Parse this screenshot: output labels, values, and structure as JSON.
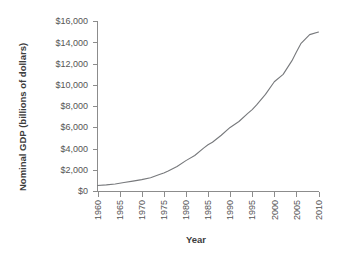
{
  "chart_data": {
    "type": "line",
    "title": "",
    "xlabel": "Year",
    "ylabel": "Nominal GDP (billions of dollars)",
    "x": [
      1960,
      1965,
      1970,
      1975,
      1980,
      1985,
      1990,
      1995,
      2000,
      2005,
      2010
    ],
    "values": [
      520,
      740,
      1070,
      1690,
      2860,
      4350,
      5980,
      7660,
      10280,
      13090,
      14960
    ],
    "xlim": [
      1960,
      2010
    ],
    "ylim": [
      0,
      16000
    ],
    "xticks": [
      1960,
      1965,
      1970,
      1975,
      1980,
      1985,
      1990,
      1995,
      2000,
      2005,
      2010
    ],
    "xtick_labels": [
      "1960",
      "1965",
      "1970",
      "1975",
      "1980",
      "1985",
      "1990",
      "1995",
      "2000",
      "2005",
      "2010"
    ],
    "yticks": [
      0,
      2000,
      4000,
      6000,
      8000,
      10000,
      12000,
      14000,
      16000
    ],
    "ytick_labels": [
      "$0",
      "$2,000",
      "$4,000",
      "$6,000",
      "$8,000",
      "$10,000",
      "$12,000",
      "$14,000",
      "$16,000"
    ],
    "grid": false,
    "legend": false,
    "series": [
      {
        "name": "Nominal GDP",
        "color": "#77797c",
        "values": [
          520,
          740,
          1070,
          1690,
          2860,
          4350,
          5980,
          7660,
          10280,
          13090,
          14960
        ]
      }
    ],
    "dense_points": {
      "x": [
        1960,
        1962,
        1964,
        1966,
        1968,
        1970,
        1972,
        1974,
        1975,
        1976,
        1978,
        1980,
        1982,
        1984,
        1985,
        1986,
        1988,
        1990,
        1992,
        1994,
        1995,
        1996,
        1998,
        2000,
        2002,
        2004,
        2005,
        2006,
        2008,
        2010
      ],
      "y": [
        520,
        580,
        660,
        800,
        930,
        1070,
        1250,
        1550,
        1690,
        1880,
        2300,
        2860,
        3340,
        4040,
        4350,
        4590,
        5250,
        5980,
        6540,
        7310,
        7660,
        8100,
        9090,
        10280,
        10980,
        12270,
        13090,
        13860,
        14720,
        14960
      ]
    }
  },
  "axis": {
    "ylabel": "Nominal GDP (billions of dollars)",
    "xlabel": "Year"
  },
  "colors": {
    "line": "#77797c",
    "axis": "#8c8c8c",
    "text": "#4a4a4a",
    "background": "#ffffff"
  }
}
